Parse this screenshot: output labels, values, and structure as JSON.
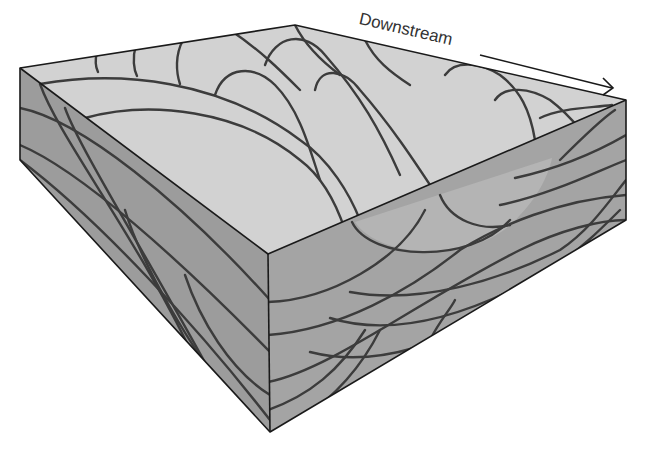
{
  "diagram": {
    "direction_label": "Downstream",
    "direction_arrow": "right-pointing arrow along top edge",
    "colors": {
      "top_surface": "#d2d2d2",
      "front_face": "#a4a4a4",
      "left_face": "#9c9c9c",
      "trough_shade": "#b4b4b4",
      "bedding_lines": "#3c3c3c",
      "outline": "#1a1a1a",
      "background": "#ffffff"
    },
    "faces": [
      "top-surface",
      "left-face",
      "front-face"
    ]
  }
}
